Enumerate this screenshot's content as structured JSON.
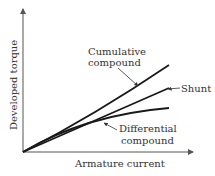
{
  "diagram": {
    "x_axis_label": "Armature current",
    "y_axis_label": "Developed torque",
    "curves": [
      {
        "name": "cumulative",
        "label_line1": "Cumulative",
        "label_line2": "compound"
      },
      {
        "name": "shunt",
        "label_line1": "Shunt"
      },
      {
        "name": "differential",
        "label_line1": "Differential",
        "label_line2": "compound"
      }
    ],
    "colors": {
      "line": "#1a1a1a",
      "axis": "#555555",
      "text": "#333333"
    }
  }
}
